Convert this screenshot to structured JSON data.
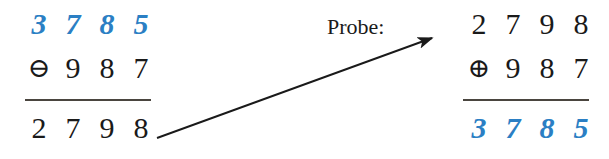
{
  "figure": {
    "background_color": "#ffffff",
    "accent_color": "#2b7fc4",
    "ink_color": "#1a1a1a",
    "rule_color": "#4a453f"
  },
  "probe": {
    "label": "Probe:",
    "arrow_icon": "arrow-right-icon"
  },
  "left_block": {
    "name": "subtraction-column",
    "operator_symbol": "⊖",
    "operator_name": "circled-minus",
    "top_row": {
      "style": "blue-italic",
      "digits": [
        "3",
        "7",
        "8",
        "5"
      ]
    },
    "operand_row": {
      "style": "black-upright",
      "digits": [
        "9",
        "8",
        "7"
      ]
    },
    "result_row": {
      "style": "black-upright",
      "digits": [
        "2",
        "7",
        "9",
        "8"
      ]
    }
  },
  "right_block": {
    "name": "addition-column",
    "operator_symbol": "⊕",
    "operator_name": "circled-plus",
    "top_row": {
      "style": "black-upright",
      "digits": [
        "2",
        "7",
        "9",
        "8"
      ]
    },
    "operand_row": {
      "style": "black-upright",
      "digits": [
        "9",
        "8",
        "7"
      ]
    },
    "result_row": {
      "style": "blue-italic",
      "digits": [
        "3",
        "7",
        "8",
        "5"
      ]
    }
  }
}
